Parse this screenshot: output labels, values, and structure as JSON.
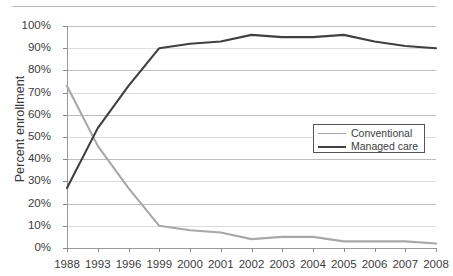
{
  "chart_data": {
    "type": "line",
    "title": "",
    "xlabel": "",
    "ylabel": "Percent enrollment",
    "ylim": [
      0,
      100
    ],
    "ytick_labels": [
      "100%",
      "90%",
      "80%",
      "70%",
      "60%",
      "50%",
      "40%",
      "30%",
      "20%",
      "10%",
      "0%"
    ],
    "ytick_values": [
      100,
      90,
      80,
      70,
      60,
      50,
      40,
      30,
      20,
      10,
      0
    ],
    "grid": true,
    "legend_position": "center-right",
    "categories": [
      "1988",
      "1993",
      "1996",
      "1999",
      "2000",
      "2001",
      "2002",
      "2003",
      "2004",
      "2005",
      "2006",
      "2007",
      "2008"
    ],
    "series": [
      {
        "name": "Conventional",
        "color": "#a8a8a8",
        "values": [
          73,
          46,
          27,
          10,
          8,
          7,
          4,
          5,
          5,
          3,
          3,
          3,
          2
        ]
      },
      {
        "name": "Managed care",
        "color": "#404040",
        "values": [
          27,
          54,
          73,
          90,
          92,
          93,
          96,
          95,
          95,
          96,
          93,
          91,
          90
        ]
      }
    ]
  },
  "legend": {
    "entries": [
      {
        "label": "Conventional"
      },
      {
        "label": "Managed care"
      }
    ]
  },
  "axes": {
    "y_title": "Percent enrollment"
  }
}
